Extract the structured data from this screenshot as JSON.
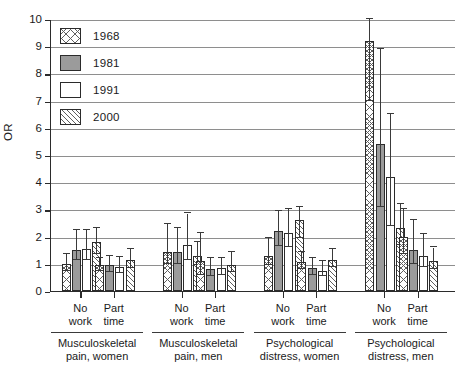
{
  "chart_data": {
    "type": "bar",
    "title": "",
    "subtitle": "",
    "xlabel": "",
    "ylabel": "OR",
    "ylim": [
      0,
      10
    ],
    "yticks": [
      0,
      1,
      2,
      3,
      4,
      5,
      6,
      7,
      8,
      9,
      10
    ],
    "grid": true,
    "legend_position": "top-left",
    "legend": [
      {
        "name": "1968",
        "pattern": "cross-hatch",
        "color": "#ffffff"
      },
      {
        "name": "1981",
        "pattern": "solid-gray",
        "color": "#9b9b9b"
      },
      {
        "name": "1991",
        "pattern": "empty-white",
        "color": "#ffffff"
      },
      {
        "name": "2000",
        "pattern": "diagonal-hatch",
        "color": "#ffffff"
      }
    ],
    "groups": [
      {
        "label_line1": "Musculoskeletal",
        "label_line2": "pain, women",
        "subgroups": [
          {
            "label_line1": "No",
            "label_line2": "work",
            "bars": [
              {
                "series": "1968",
                "value": 1.0,
                "ci_low": 0.75,
                "ci_high": 1.35
              },
              {
                "series": "1981",
                "value": 1.5,
                "ci_low": 1.15,
                "ci_high": 2.25
              },
              {
                "series": "1991",
                "value": 1.55,
                "ci_low": 1.15,
                "ci_high": 2.25
              },
              {
                "series": "2000",
                "value": 1.8,
                "ci_low": 1.35,
                "ci_high": 2.3
              }
            ]
          },
          {
            "label_line1": "Part",
            "label_line2": "time",
            "bars": [
              {
                "series": "1968",
                "value": 0.95,
                "ci_low": 0.75,
                "ci_high": 1.2
              },
              {
                "series": "1981",
                "value": 0.95,
                "ci_low": 0.7,
                "ci_high": 1.3
              },
              {
                "series": "1991",
                "value": 0.9,
                "ci_low": 0.65,
                "ci_high": 1.25
              },
              {
                "series": "2000",
                "value": 1.15,
                "ci_low": 0.85,
                "ci_high": 1.55
              }
            ]
          }
        ]
      },
      {
        "label_line1": "Musculoskeletal",
        "label_line2": "pain, men",
        "subgroups": [
          {
            "label_line1": "No",
            "label_line2": "work",
            "bars": [
              {
                "series": "1968",
                "value": 1.45,
                "ci_low": 1.0,
                "ci_high": 2.45
              },
              {
                "series": "1981",
                "value": 1.45,
                "ci_low": 1.0,
                "ci_high": 2.3
              },
              {
                "series": "1991",
                "value": 1.7,
                "ci_low": 1.15,
                "ci_high": 2.85
              },
              {
                "series": "2000",
                "value": 1.3,
                "ci_low": 0.95,
                "ci_high": 1.8
              }
            ]
          },
          {
            "label_line1": "Part",
            "label_line2": "time",
            "bars": [
              {
                "series": "1968",
                "value": 1.1,
                "ci_low": 0.6,
                "ci_high": 2.15
              },
              {
                "series": "1981",
                "value": 0.8,
                "ci_low": 0.55,
                "ci_high": 1.2
              },
              {
                "series": "1991",
                "value": 0.85,
                "ci_low": 0.6,
                "ci_high": 1.2
              },
              {
                "series": "2000",
                "value": 0.95,
                "ci_low": 0.7,
                "ci_high": 1.45
              }
            ]
          }
        ]
      },
      {
        "label_line1": "Psychological",
        "label_line2": "distress, women",
        "subgroups": [
          {
            "label_line1": "No",
            "label_line2": "work",
            "bars": [
              {
                "series": "1968",
                "value": 1.3,
                "ci_low": 0.95,
                "ci_high": 1.95
              },
              {
                "series": "1981",
                "value": 2.2,
                "ci_low": 1.65,
                "ci_high": 2.95
              },
              {
                "series": "1991",
                "value": 2.15,
                "ci_low": 1.6,
                "ci_high": 3.0
              },
              {
                "series": "2000",
                "value": 2.6,
                "ci_low": 1.95,
                "ci_high": 3.1
              }
            ]
          },
          {
            "label_line1": "Part",
            "label_line2": "time",
            "bars": [
              {
                "series": "1968",
                "value": 1.05,
                "ci_low": 0.8,
                "ci_high": 1.45
              },
              {
                "series": "1981",
                "value": 0.85,
                "ci_low": 0.6,
                "ci_high": 1.2
              },
              {
                "series": "1991",
                "value": 0.75,
                "ci_low": 0.55,
                "ci_high": 1.1
              },
              {
                "series": "2000",
                "value": 1.15,
                "ci_low": 0.9,
                "ci_high": 1.55
              }
            ]
          }
        ]
      },
      {
        "label_line1": "Psychological",
        "label_line2": "distress, men",
        "subgroups": [
          {
            "label_line1": "No",
            "label_line2": "work",
            "bars": [
              {
                "series": "1968",
                "value": 9.2,
                "ci_low": 7.0,
                "ci_high": 10.0
              },
              {
                "series": "1981",
                "value": 5.4,
                "ci_low": 3.1,
                "ci_high": 8.9
              },
              {
                "series": "1991",
                "value": 4.2,
                "ci_low": 2.4,
                "ci_high": 6.5
              },
              {
                "series": "2000",
                "value": 2.3,
                "ci_low": 1.7,
                "ci_high": 3.2
              }
            ]
          },
          {
            "label_line1": "Part",
            "label_line2": "time",
            "bars": [
              {
                "series": "1968",
                "value": 2.0,
                "ci_low": 1.35,
                "ci_high": 3.0
              },
              {
                "series": "1981",
                "value": 1.5,
                "ci_low": 1.0,
                "ci_high": 2.6
              },
              {
                "series": "1991",
                "value": 1.3,
                "ci_low": 0.9,
                "ci_high": 2.1
              },
              {
                "series": "2000",
                "value": 1.1,
                "ci_low": 0.8,
                "ci_high": 1.6
              }
            ]
          }
        ]
      }
    ]
  }
}
